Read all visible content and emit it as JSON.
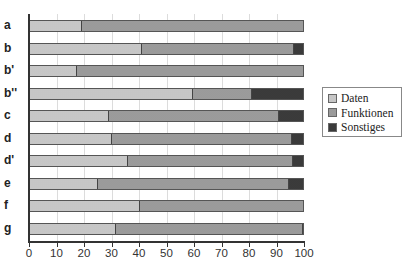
{
  "chart_data": {
    "type": "bar",
    "orientation": "horizontal",
    "stacked": true,
    "title": "",
    "xlabel": "",
    "ylabel": "",
    "xlim": [
      0,
      100
    ],
    "xticks": [
      0,
      10,
      20,
      30,
      40,
      50,
      60,
      70,
      80,
      90,
      100
    ],
    "grid": true,
    "legend_position": "right",
    "categories": [
      "a",
      "b",
      "b'",
      "b''",
      "c",
      "d",
      "d'",
      "e",
      "f",
      "g"
    ],
    "series": [
      {
        "name": "Daten",
        "color": "#e6e6e6",
        "values": [
          18.5,
          40.5,
          17,
          59.5,
          28.5,
          29.5,
          35.5,
          24.5,
          40,
          31
        ]
      },
      {
        "name": "Funktionen",
        "color": "#b9b9b9",
        "values": [
          81.5,
          56,
          83,
          21.5,
          62.5,
          66,
          60.5,
          70,
          60,
          68.5
        ]
      },
      {
        "name": "Sonstiges",
        "color": "#6a6a6a",
        "values": [
          0,
          3.5,
          0,
          19,
          9,
          4.5,
          4,
          5.5,
          0,
          0.5
        ]
      }
    ]
  },
  "legend": {
    "items": [
      {
        "label": "Daten"
      },
      {
        "label": "Funktionen"
      },
      {
        "label": "Sonstiges"
      }
    ]
  }
}
